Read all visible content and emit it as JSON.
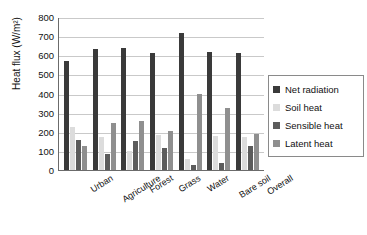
{
  "chart_data": {
    "type": "bar",
    "title": "",
    "xlabel": "",
    "ylabel": "Heat flux (W/m2)",
    "ylabel_display": "Heat flux (W/m²)",
    "ylim": [
      0,
      800
    ],
    "yticks": [
      0,
      100,
      200,
      300,
      400,
      500,
      600,
      700,
      800
    ],
    "ytick_labels": [
      "0",
      "100",
      "200",
      "300",
      "400",
      "500",
      "600",
      "700",
      "800"
    ],
    "grid": true,
    "legend_position": "right",
    "categories": [
      "Urban",
      "Agriculture",
      "Forest",
      "Grass",
      "Water",
      "Bare soil",
      "Overall"
    ],
    "series": [
      {
        "name": "Net radiation",
        "color": "#3a3a3a",
        "values": [
          568,
          632,
          638,
          613,
          715,
          615,
          612
        ]
      },
      {
        "name": "Soil heat",
        "color": "#dcdcdc",
        "values": [
          225,
          175,
          100,
          182,
          60,
          180,
          175
        ]
      },
      {
        "name": "Sensible heat",
        "color": "#5c5c5c",
        "values": [
          155,
          85,
          150,
          115,
          25,
          35,
          125
        ]
      },
      {
        "name": "Latent heat",
        "color": "#8f8f8f",
        "values": [
          125,
          245,
          255,
          205,
          395,
          325,
          190
        ]
      }
    ]
  },
  "legend": {
    "items": [
      {
        "label": "Net radiation",
        "color": "#3a3a3a"
      },
      {
        "label": "Soil heat",
        "color": "#dcdcdc"
      },
      {
        "label": "Sensible heat",
        "color": "#5c5c5c"
      },
      {
        "label": "Latent heat",
        "color": "#8f8f8f"
      }
    ]
  }
}
